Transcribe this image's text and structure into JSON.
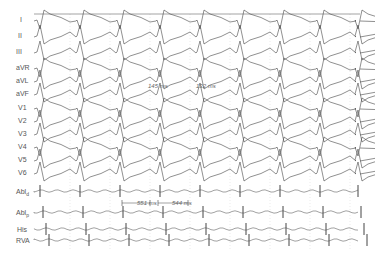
{
  "figure": {
    "type": "intracardiac electrogram tracing",
    "leads": [
      {
        "id": "I",
        "label": "I",
        "y": 19
      },
      {
        "id": "II",
        "label": "II",
        "y": 35
      },
      {
        "id": "III",
        "label": "III",
        "y": 51
      },
      {
        "id": "aVR",
        "label": "aVR",
        "y": 67
      },
      {
        "id": "aVL",
        "label": "aVL",
        "y": 80
      },
      {
        "id": "aVF",
        "label": "aVF",
        "y": 93
      },
      {
        "id": "V1",
        "label": "V1",
        "y": 107
      },
      {
        "id": "V2",
        "label": "V2",
        "y": 120
      },
      {
        "id": "V3",
        "label": "V3",
        "y": 133
      },
      {
        "id": "V4",
        "label": "V4",
        "y": 146
      },
      {
        "id": "V5",
        "label": "V5",
        "y": 159
      },
      {
        "id": "V6",
        "label": "V6",
        "y": 172
      }
    ],
    "intracardiac": [
      {
        "id": "Abl-d",
        "label": "Abl",
        "sub": "d",
        "y": 191
      },
      {
        "id": "Abl-p",
        "label": "Abl",
        "sub": "p",
        "y": 212
      },
      {
        "id": "His",
        "label": "His",
        "y": 229
      },
      {
        "id": "RVA",
        "label": "RVA",
        "y": 240
      }
    ],
    "annotations": {
      "interval_1": "145 ms",
      "interval_2": "132 ms",
      "cycle_1": "551 ms",
      "cycle_2": "544 ms"
    },
    "colors": {
      "trace": "#444444",
      "label": "#555555",
      "grid": "#bbbbbb"
    }
  }
}
